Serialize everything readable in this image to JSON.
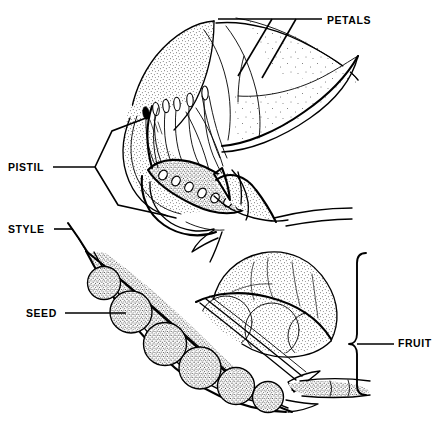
{
  "figure": {
    "kind": "botanical-line-diagram",
    "width": 444,
    "height": 433,
    "background_color": "#ffffff",
    "ink_color": "#000000",
    "style": "black-and-white stippled pen-and-ink line art"
  },
  "labels": [
    {
      "id": "petals",
      "text": "PETALS",
      "text_x": 327,
      "text_y": 21,
      "anchor": "start",
      "leader_kind": "multi-branch",
      "points_to": "standard, wing and keel petals of the flower"
    },
    {
      "id": "pistil",
      "text": "PISTIL",
      "text_x": 8,
      "text_y": 168,
      "anchor": "start",
      "leader_kind": "forked",
      "points_to": "style, ovary and ovules inside the flower"
    },
    {
      "id": "style",
      "text": "STYLE",
      "text_x": 8,
      "text_y": 230,
      "anchor": "start",
      "leader_kind": "straight",
      "points_to": "persistent style at the tip of the pod"
    },
    {
      "id": "seed",
      "text": "SEED",
      "text_x": 26,
      "text_y": 314,
      "anchor": "start",
      "leader_kind": "straight",
      "points_to": "one seed inside the opened pod"
    },
    {
      "id": "fruit",
      "text": "FRUIT",
      "text_x": 398,
      "text_y": 344,
      "anchor": "start",
      "leader_kind": "curly-brace",
      "points_to": "the whole pod, a legume fruit"
    }
  ],
  "parts": {
    "flower": {
      "name": "flower-longitudinal-section",
      "position": "upper half of image",
      "structures": [
        "standard petal",
        "wing petal",
        "keel petal",
        "stamens with anthers",
        "style",
        "ovary",
        "ovules",
        "receptacle",
        "calyx"
      ],
      "ovule_count": 7,
      "anther_count": 6
    },
    "fruit": {
      "name": "opened-legume-pod",
      "position": "lower half of image",
      "structures": [
        "pod valve",
        "persistent style",
        "seeds",
        "pedicel",
        "sepal remnants"
      ],
      "seed_count_lower_row": 6,
      "seed_count_upper_row": 3
    }
  }
}
